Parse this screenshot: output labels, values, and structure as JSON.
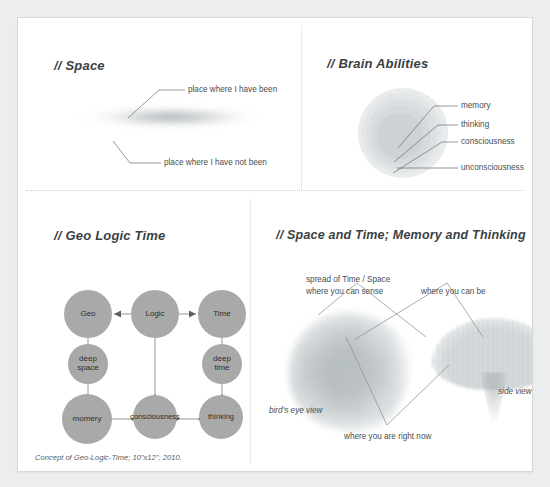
{
  "artwork": {
    "caption": "Concept of Geo-Logic-Time; 10\"x12\"; 2010."
  },
  "panels": {
    "space": {
      "title": "// Space",
      "labels": {
        "been": "place where I have been",
        "not_been": "place where I have not been"
      },
      "shape_name": "blurred-ellipse"
    },
    "brain": {
      "title": "// Brain Abilities",
      "labels": [
        "memory",
        "thinking",
        "consciousness",
        "unconsciousness"
      ]
    },
    "geo_logic_time": {
      "title": "// Geo Logic Time",
      "nodes": [
        {
          "id": "geo",
          "label": "Geo"
        },
        {
          "id": "logic",
          "label": "Logic"
        },
        {
          "id": "time",
          "label": "Time"
        },
        {
          "id": "deep-space",
          "label": "deep\nspace"
        },
        {
          "id": "deep-time",
          "label": "deep\ntime"
        },
        {
          "id": "momery",
          "label": "momery"
        },
        {
          "id": "consciousness",
          "label": "consciousness"
        },
        {
          "id": "thinking",
          "label": "thinking"
        }
      ],
      "node_color": "#a9a9a9"
    },
    "space_time_memory": {
      "title": "// Space and Time; Memory and Thinking",
      "labels": {
        "spread_line1": "spread of Time / Space",
        "spread_line2": "where you can sense",
        "can_be": "where you can be",
        "right_now": "where you are right now",
        "birds_eye": "bird's eye view",
        "side": "side view"
      }
    }
  },
  "colors": {
    "page_background": "#eceded",
    "card_background": "#ffffff",
    "card_border": "#d8d9da",
    "divider": "#d2d4d5",
    "text": "#4a4e51",
    "title_text": "#3b3f42",
    "node_fill": "#a9a9a9",
    "leader_line": "#6f7477"
  }
}
